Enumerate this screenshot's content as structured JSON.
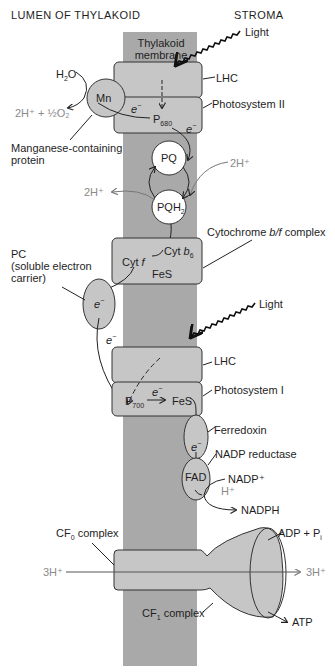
{
  "headers": {
    "lumen": "LUMEN OF THYLAKOID",
    "stroma": "STROMA"
  },
  "membrane": {
    "label_line1": "Thylakoid",
    "label_line2": "membrane"
  },
  "colors": {
    "membrane_band": "#a9a9a9",
    "complex_fill": "#c6c6c6",
    "carrier_fill": "#ffffff",
    "outline": "#3a3a3a",
    "proton_text": "#8a8a8a"
  },
  "photosystem2": {
    "light": "Light",
    "lhc": "LHC",
    "name": "Photosystem II",
    "reaction_center": "P",
    "reaction_center_sub": "680",
    "electron": "e",
    "electron_sup": "−",
    "water": "H",
    "water_sub": "2",
    "water_tail": "O",
    "oxygen_products": "2H⁺ + ½O₂",
    "mn": "Mn",
    "mn_label_line1": "Manganese-containing",
    "mn_label_line2": "protein"
  },
  "plastoquinone": {
    "pq": "PQ",
    "pqh2": "PQH",
    "pqh2_sub": "2",
    "proton_in": "2H⁺",
    "proton_out": "2H⁺"
  },
  "cytochrome": {
    "name_pre": "Cytochrome ",
    "name_italic": "b/f",
    "name_post": " complex",
    "cyt_b": "Cyt ",
    "cyt_b_italic": "b",
    "cyt_b_sub": "6",
    "cyt_f": "Cyt ",
    "cyt_f_italic": "f",
    "fes": "FeS"
  },
  "plastocyanin": {
    "label_line1": "PC",
    "label_line2": "(soluble electron",
    "label_line3": "carrier)",
    "electron": "e",
    "electron_sup": "−"
  },
  "photosystem1": {
    "light": "Light",
    "lhc": "LHC",
    "name": "Photosystem I",
    "reaction_center": "P",
    "reaction_center_sub": "700",
    "electron": "e",
    "electron_sup": "−",
    "fes": "FeS"
  },
  "ferredoxin": {
    "name": "Ferredoxin",
    "electron": "e",
    "electron_sup": "−"
  },
  "nadp_reductase": {
    "name": "NADP reductase",
    "fad": "FAD",
    "nadp": "NADP⁺",
    "proton": "H⁺",
    "nadph": "NADPH"
  },
  "atp_synthase": {
    "cf0_pre": "CF",
    "cf0_sub": "0",
    "cf0_post": " complex",
    "cf1_pre": "CF",
    "cf1_sub": "1",
    "cf1_post": " complex",
    "proton_in": "3H⁺",
    "proton_out": "3H⁺",
    "adp": "ADP + P",
    "adp_sub": "i",
    "atp": "ATP"
  }
}
